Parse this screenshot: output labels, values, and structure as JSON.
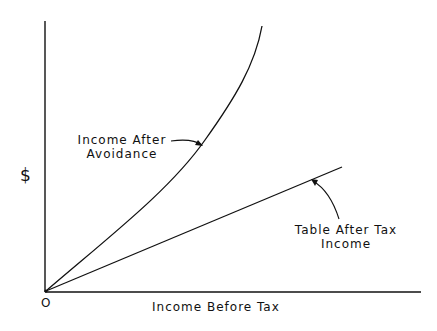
{
  "diagram": {
    "y_axis_label": "$",
    "x_axis_label": "Income Before Tax",
    "origin_label": "O",
    "curves": [
      {
        "name": "income-after-avoidance",
        "label_line1": "Income After",
        "label_line2": "Avoidance",
        "shape": "convex curve rising steeply"
      },
      {
        "name": "table-after-tax-income",
        "label_line1": "Table After Tax",
        "label_line2": "Income",
        "shape": "straight line"
      }
    ],
    "colors": {
      "line": "#111111",
      "background": "#ffffff"
    }
  }
}
